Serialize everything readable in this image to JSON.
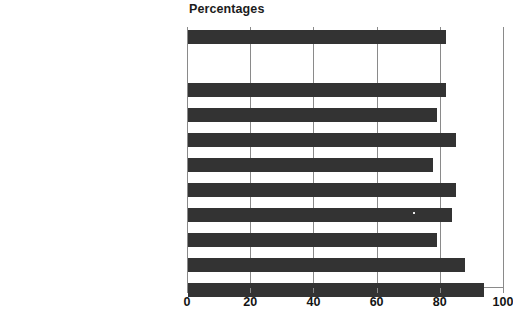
{
  "chart_data": {
    "type": "bar",
    "orientation": "horizontal",
    "title": "Percentages",
    "xlabel": "",
    "ylabel": "",
    "xlim": [
      0,
      100
    ],
    "xticks": [
      0,
      20,
      40,
      60,
      80,
      100
    ],
    "xtick_labels": [
      "0",
      "20",
      "40",
      "60",
      "80",
      "100"
    ],
    "grid": true,
    "legend": false,
    "bar_color": "#333333",
    "axis_color": "#8a8a8a",
    "categories": [
      "England",
      "North East",
      "North West",
      "Yorkshire and The Humber",
      "East Midlands",
      "West Midlands",
      "East of England",
      "London",
      "South East",
      "South West"
    ],
    "values": [
      82,
      82,
      79,
      85,
      78,
      85,
      84,
      79,
      88,
      94
    ],
    "bars": [
      {
        "label": "England",
        "value": 82,
        "top": 3,
        "separated": true
      },
      {
        "label": "North East",
        "value": 82,
        "top": 56,
        "separated": false
      },
      {
        "label": "North West",
        "value": 79,
        "top": 81,
        "separated": false
      },
      {
        "label": "Yorkshire and The Humber",
        "value": 85,
        "top": 106,
        "separated": false
      },
      {
        "label": "East Midlands",
        "value": 78,
        "top": 131,
        "separated": false
      },
      {
        "label": "West Midlands",
        "value": 85,
        "top": 156,
        "separated": false
      },
      {
        "label": "East of England",
        "value": 84,
        "top": 181,
        "separated": false
      },
      {
        "label": "London",
        "value": 79,
        "top": 206,
        "separated": false
      },
      {
        "label": "South East",
        "value": 88,
        "top": 231,
        "separated": false
      },
      {
        "label": "South West",
        "value": 94,
        "top": 256,
        "separated": false
      }
    ]
  }
}
